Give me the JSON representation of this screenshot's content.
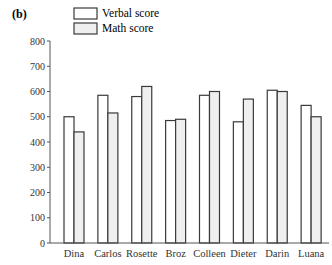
{
  "panel_label": "(b)",
  "legend": [
    {
      "label": "Verbal score",
      "fill": "#ffffff"
    },
    {
      "label": "Math score",
      "fill": "#efefef"
    }
  ],
  "colors": {
    "stroke": "#3a3a3a",
    "verbal_fill": "#ffffff",
    "math_fill": "#efefef",
    "axis": "#555555"
  },
  "chart_data": {
    "type": "bar",
    "title": "",
    "xlabel": "",
    "ylabel": "",
    "ylim": [
      0,
      800
    ],
    "yticks": [
      0,
      100,
      200,
      300,
      400,
      500,
      600,
      700,
      800
    ],
    "grid": false,
    "legend_position": "top",
    "categories": [
      "Dina",
      "Carlos",
      "Rosette",
      "Broz",
      "Colleen",
      "Dieter",
      "Darin",
      "Luana"
    ],
    "series": [
      {
        "name": "Verbal score",
        "values": [
          500,
          585,
          580,
          485,
          585,
          480,
          605,
          545
        ]
      },
      {
        "name": "Math score",
        "values": [
          440,
          515,
          620,
          490,
          600,
          570,
          600,
          500
        ]
      }
    ]
  }
}
